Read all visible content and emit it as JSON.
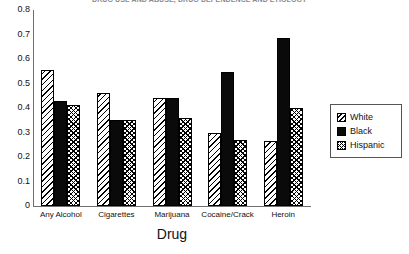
{
  "running_header": "DRUG USE AND ABUSE, DRUG DEPENDENCE AND ETIOLOGY",
  "chart_data": {
    "type": "bar",
    "title": "",
    "xlabel": "Drug",
    "ylabel": "",
    "ylim": [
      0,
      0.8
    ],
    "ytick_labels": [
      "0.8",
      "0.7",
      "0.6",
      "0.5",
      "0.4",
      "0.3",
      "0.2",
      "0.1",
      "0"
    ],
    "ytick_values": [
      0.8,
      0.7,
      0.6,
      0.5,
      0.4,
      0.3,
      0.2,
      0.1,
      0
    ],
    "grid": false,
    "legend_position": "right",
    "categories": [
      "Any Alcohol",
      "Cigarettes",
      "Marijuana",
      "Cocaine/Crack",
      "Heroin"
    ],
    "series": [
      {
        "name": "White",
        "pattern": "diagonal-hatch",
        "values": [
          0.555,
          0.46,
          0.44,
          0.3,
          0.265
        ]
      },
      {
        "name": "Black",
        "pattern": "solid",
        "values": [
          0.43,
          0.35,
          0.44,
          0.545,
          0.685
        ]
      },
      {
        "name": "Hispanic",
        "pattern": "cross-hatch",
        "values": [
          0.412,
          0.35,
          0.36,
          0.27,
          0.4
        ]
      }
    ]
  },
  "legend": {
    "items": [
      {
        "label": "White"
      },
      {
        "label": "Black"
      },
      {
        "label": "Hispanic"
      }
    ]
  },
  "colors": {
    "axis": "#6f6f6f",
    "bar_black": "#0a0a0a",
    "text": "#111111",
    "header_text": "#8a8a8a",
    "legend_border": "#555555"
  }
}
